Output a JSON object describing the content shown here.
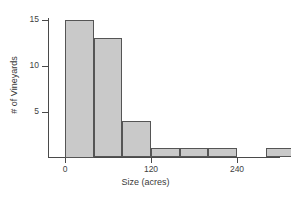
{
  "chart_data": {
    "type": "bar",
    "title": "",
    "subtitle": "",
    "xlabel": "Size (acres)",
    "ylabel": "# of Vineyards",
    "grid": false,
    "legend": false,
    "legend_position": "none",
    "bin_width": 40,
    "xlim": [
      -20,
      320
    ],
    "ylim": [
      0,
      16
    ],
    "xticks": [
      0,
      120,
      240
    ],
    "xtick_labels": [
      "0",
      "120",
      "240"
    ],
    "yticks": [
      5,
      10,
      15
    ],
    "ytick_labels": [
      "5",
      "10",
      "15"
    ],
    "categories": [
      "0-40",
      "40-80",
      "80-120",
      "120-160",
      "160-200",
      "200-240",
      "240-280",
      "280-320"
    ],
    "bin_starts": [
      0,
      40,
      80,
      120,
      160,
      200,
      240,
      280
    ],
    "x": [
      0,
      40,
      80,
      120,
      160,
      200,
      240,
      280
    ],
    "values": [
      15,
      13,
      4,
      1,
      1,
      1,
      0,
      1
    ],
    "series": [
      {
        "name": "# of Vineyards",
        "values": [
          15,
          13,
          4,
          1,
          1,
          1,
          0,
          1
        ]
      }
    ],
    "colors": {
      "bar_fill": "#c9c9c9",
      "bar_border": "#555555",
      "axis": "#4a4a4a",
      "text": "#3a3a3a",
      "background": "#ffffff"
    }
  }
}
